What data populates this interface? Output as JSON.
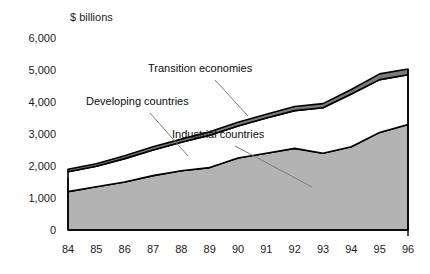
{
  "chart_data": {
    "type": "area",
    "stacked": true,
    "title": "",
    "subtitle": "",
    "unit_label": "$ billions",
    "xlabel": "",
    "ylabel": "",
    "grid": false,
    "legend_position": "inline-annotations",
    "categories": [
      "84",
      "85",
      "86",
      "87",
      "88",
      "89",
      "90",
      "91",
      "92",
      "93",
      "94",
      "95",
      "96"
    ],
    "xlim": [
      "84",
      "96"
    ],
    "ylim": [
      0,
      6000
    ],
    "ytick_labels": [
      "0",
      "1,000",
      "2,000",
      "3,000",
      "4,000",
      "5,000",
      "6,000"
    ],
    "ytick_values": [
      0,
      1000,
      2000,
      3000,
      4000,
      5000,
      6000
    ],
    "series": [
      {
        "name": "Industrial countries",
        "color": "#b3b3b3",
        "values": [
          1200,
          1350,
          1500,
          1700,
          1850,
          1950,
          2250,
          2400,
          2550,
          2400,
          2600,
          3050,
          3300
        ]
      },
      {
        "name": "Developing countries",
        "color": "#ffffff",
        "values": [
          620,
          640,
          730,
          800,
          890,
          1010,
          1000,
          1100,
          1180,
          1420,
          1650,
          1650,
          1550
        ]
      },
      {
        "name": "Transition economies",
        "color": "#7a7a7a",
        "values": [
          80,
          80,
          90,
          100,
          100,
          110,
          120,
          120,
          130,
          130,
          140,
          180,
          180
        ]
      }
    ],
    "stack_totals": [
      1900,
      2070,
      2320,
      2600,
      2840,
      3070,
      3370,
      3620,
      3860,
      3950,
      4390,
      4880,
      5030
    ],
    "annotations": [
      {
        "text": "Transition economies",
        "anchor_year": "90"
      },
      {
        "text": "Developing countries",
        "anchor_year": "88"
      },
      {
        "text": "Industrial countries",
        "anchor_year": "92"
      }
    ]
  }
}
